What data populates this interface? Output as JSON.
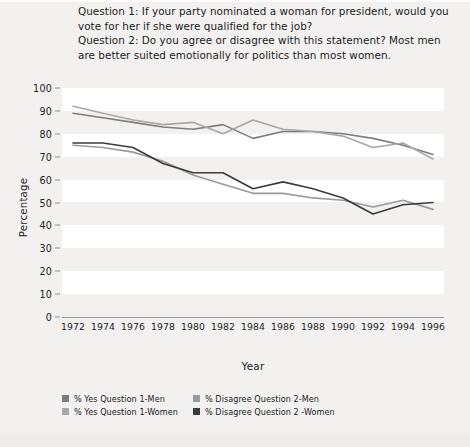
{
  "header": {
    "question1": "Question 1: If your party nominated a woman for president, would you vote for her if she were qualified for the job?",
    "question2": "Question 2: Do you agree or disagree with this statement? Most men are better suited emotionally for politics than most women."
  },
  "colors": {
    "background": "#f2f1ef",
    "plot_band": "#ffffff",
    "yes_men": "#7d7d7d",
    "yes_women": "#a8a8a8",
    "disagree_men": "#9a9a9a",
    "disagree_women": "#3b3b3b",
    "axis": "#8e8e8e",
    "text": "#222222"
  },
  "chart_data": {
    "type": "line",
    "title": "",
    "xlabel": "Year",
    "ylabel": "Percentage",
    "ylim": [
      0,
      100
    ],
    "ytick_step": 10,
    "grid": "horizontal-bands",
    "legend_position": "bottom",
    "categories": [
      1972,
      1974,
      1976,
      1978,
      1980,
      1982,
      1984,
      1986,
      1988,
      1990,
      1992,
      1994,
      1996
    ],
    "yticks": [
      100,
      90,
      80,
      70,
      60,
      50,
      40,
      30,
      20,
      10,
      0
    ],
    "xticks": [
      "1972",
      "1974",
      "1976",
      "1978",
      "1980",
      "1982",
      "1984",
      "1986",
      "1988",
      "1990",
      "1992",
      "1994",
      "1996"
    ],
    "series": [
      {
        "name": "% Yes Question 1-Men",
        "color": "#7d7d7d",
        "values": [
          89,
          87,
          85,
          83,
          82,
          84,
          78,
          81,
          81,
          80,
          78,
          75,
          71
        ]
      },
      {
        "name": "% Yes Question 1-Women",
        "color": "#a8a8a8",
        "values": [
          92,
          89,
          86,
          84,
          85,
          80,
          86,
          82,
          81,
          79,
          74,
          76,
          69
        ]
      },
      {
        "name": "% Disagree Question 2-Men",
        "color": "#9a9a9a",
        "values": [
          75,
          74,
          72,
          68,
          62,
          58,
          54,
          54,
          52,
          51,
          48,
          51,
          47
        ]
      },
      {
        "name": "% Disagree Question 2 -Women",
        "color": "#3b3b3b",
        "values": [
          76,
          76,
          74,
          67,
          63,
          63,
          56,
          59,
          56,
          52,
          45,
          49,
          50
        ]
      }
    ]
  },
  "legend": [
    {
      "label": "% Yes Question 1-Men",
      "color": "#7d7d7d"
    },
    {
      "label": "% Disagree Question 2-Men",
      "color": "#9a9a9a"
    },
    {
      "label": "% Yes Question 1-Women",
      "color": "#a8a8a8"
    },
    {
      "label": "% Disagree Question 2 -Women",
      "color": "#3b3b3b"
    }
  ]
}
